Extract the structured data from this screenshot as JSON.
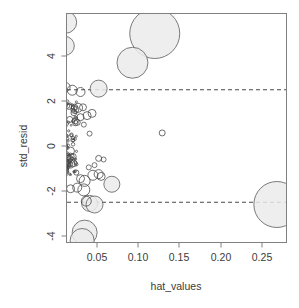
{
  "chart_data": {
    "type": "scatter",
    "title": "",
    "subtitle": "",
    "xlabel": "hat_values",
    "ylabel": "std_resid",
    "xlim": [
      0.0,
      0.281
    ],
    "ylim": [
      -4.75,
      5.9
    ],
    "grid": false,
    "legend": null,
    "xticks": [
      0.05,
      0.1,
      0.15,
      0.2,
      0.25
    ],
    "xticklabels": [
      "0.05",
      "0.10",
      "0.15",
      "0.20",
      "0.25"
    ],
    "yticks": [
      4,
      2,
      0,
      -2,
      -4
    ],
    "yticklabels": [
      "4",
      "2",
      "0",
      "-2",
      "-4"
    ],
    "annotations": [
      {
        "kind": "hline",
        "y": 2.5,
        "style": "dashed",
        "label": "upper residual cutoff"
      },
      {
        "kind": "hline",
        "y": -2.5,
        "style": "dashed",
        "label": "lower residual cutoff"
      }
    ],
    "point_encoding": {
      "x": "hat_values",
      "y": "std_resid",
      "size": "cooks_distance (bubble radius)",
      "marker": "open circle"
    },
    "points": [
      {
        "x": 0.012,
        "y": 5.5,
        "r": 11.0
      },
      {
        "x": 0.011,
        "y": 4.45,
        "r": 9.5
      },
      {
        "x": 0.12,
        "y": 5.0,
        "r": 25.0
      },
      {
        "x": 0.093,
        "y": 3.7,
        "r": 15.5
      },
      {
        "x": 0.268,
        "y": -2.6,
        "r": 23.0
      },
      {
        "x": 0.035,
        "y": -3.85,
        "r": 12.5
      },
      {
        "x": 0.032,
        "y": -4.2,
        "r": 12.0
      },
      {
        "x": 0.052,
        "y": 2.55,
        "r": 8.5
      },
      {
        "x": 0.012,
        "y": 2.62,
        "r": 4.5
      },
      {
        "x": 0.02,
        "y": 2.48,
        "r": 5.0
      },
      {
        "x": 0.03,
        "y": 2.4,
        "r": 4.5
      },
      {
        "x": 0.068,
        "y": -1.7,
        "r": 8.0
      },
      {
        "x": 0.041,
        "y": -2.55,
        "r": 8.0
      },
      {
        "x": 0.047,
        "y": -2.6,
        "r": 8.5
      },
      {
        "x": 0.037,
        "y": -2.45,
        "r": 5.0
      },
      {
        "x": 0.034,
        "y": -1.95,
        "r": 6.0
      },
      {
        "x": 0.035,
        "y": -1.55,
        "r": 5.5
      },
      {
        "x": 0.045,
        "y": -1.3,
        "r": 5.0
      },
      {
        "x": 0.052,
        "y": -1.25,
        "r": 4.5
      },
      {
        "x": 0.055,
        "y": -1.35,
        "r": 4.0
      },
      {
        "x": 0.026,
        "y": -1.85,
        "r": 4.5
      },
      {
        "x": 0.018,
        "y": -1.9,
        "r": 4.0
      },
      {
        "x": 0.03,
        "y": -1.45,
        "r": 4.0
      },
      {
        "x": 0.023,
        "y": 1.62,
        "r": 4.0
      },
      {
        "x": 0.027,
        "y": 1.7,
        "r": 4.5
      },
      {
        "x": 0.033,
        "y": 1.72,
        "r": 3.5
      },
      {
        "x": 0.038,
        "y": 1.35,
        "r": 4.0
      },
      {
        "x": 0.044,
        "y": 1.45,
        "r": 4.0
      },
      {
        "x": 0.03,
        "y": 1.28,
        "r": 3.5
      },
      {
        "x": 0.022,
        "y": 1.48,
        "r": 3.0
      },
      {
        "x": 0.017,
        "y": 1.18,
        "r": 3.0
      },
      {
        "x": 0.013,
        "y": 1.95,
        "r": 2.5
      },
      {
        "x": 0.016,
        "y": 1.75,
        "r": 2.8
      },
      {
        "x": 0.026,
        "y": 1.05,
        "r": 3.0
      },
      {
        "x": 0.034,
        "y": 0.95,
        "r": 2.5
      },
      {
        "x": 0.041,
        "y": 0.55,
        "r": 2.5
      },
      {
        "x": 0.129,
        "y": 0.58,
        "r": 3.0
      },
      {
        "x": 0.052,
        "y": -0.55,
        "r": 3.0
      },
      {
        "x": 0.058,
        "y": -0.6,
        "r": 2.5
      },
      {
        "x": 0.047,
        "y": -0.85,
        "r": 2.5
      },
      {
        "x": 0.04,
        "y": -0.95,
        "r": 2.5
      },
      {
        "x": 0.012,
        "y": 0.05,
        "r": 2.0
      },
      {
        "x": 0.014,
        "y": -0.35,
        "r": 2.0
      },
      {
        "x": 0.01,
        "y": 0.45,
        "r": 2.0
      },
      {
        "x": 0.011,
        "y": -0.75,
        "r": 2.0
      }
    ],
    "cluster_note": "dense cluster of ~180 small open circles at hat_values < 0.02, std_resid between -1.5 and 2.0"
  },
  "axes": {
    "x_title": "hat_values",
    "y_title": "std_resid"
  }
}
